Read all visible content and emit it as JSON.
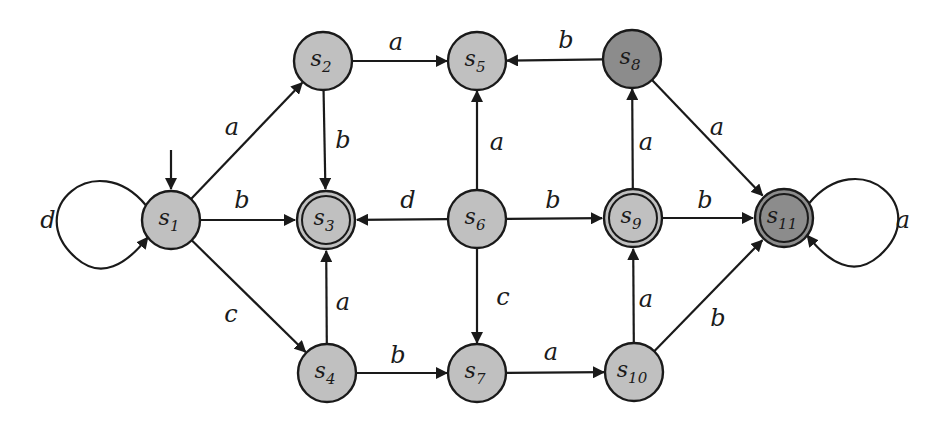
{
  "diagram": {
    "type": "finite-automaton",
    "colors": {
      "state_fill": "#c0c0c0",
      "state_fill_dark": "#8c8c8c",
      "stroke": "#1a1a1a",
      "background": "#ffffff"
    },
    "states": [
      {
        "id": "s1",
        "base": "s",
        "sub": "1",
        "x": 171,
        "y": 220,
        "accepting": false,
        "dark": false,
        "initial": true
      },
      {
        "id": "s2",
        "base": "s",
        "sub": "2",
        "x": 323,
        "y": 61,
        "accepting": false,
        "dark": false,
        "initial": false
      },
      {
        "id": "s3",
        "base": "s",
        "sub": "3",
        "x": 326,
        "y": 220,
        "accepting": true,
        "dark": false,
        "initial": false
      },
      {
        "id": "s4",
        "base": "s",
        "sub": "4",
        "x": 327,
        "y": 373,
        "accepting": false,
        "dark": false,
        "initial": false
      },
      {
        "id": "s5",
        "base": "s",
        "sub": "5",
        "x": 477,
        "y": 61,
        "accepting": false,
        "dark": false,
        "initial": false
      },
      {
        "id": "s6",
        "base": "s",
        "sub": "6",
        "x": 477,
        "y": 219,
        "accepting": false,
        "dark": false,
        "initial": false
      },
      {
        "id": "s7",
        "base": "s",
        "sub": "7",
        "x": 477,
        "y": 373,
        "accepting": false,
        "dark": false,
        "initial": false
      },
      {
        "id": "s8",
        "base": "s",
        "sub": "8",
        "x": 632,
        "y": 59,
        "accepting": false,
        "dark": true,
        "initial": false
      },
      {
        "id": "s9",
        "base": "s",
        "sub": "9",
        "x": 633,
        "y": 218,
        "accepting": true,
        "dark": false,
        "initial": false
      },
      {
        "id": "s10",
        "base": "s",
        "sub": "10",
        "x": 634,
        "y": 372,
        "accepting": false,
        "dark": false,
        "initial": false
      },
      {
        "id": "s11",
        "base": "s",
        "sub": "11",
        "x": 784,
        "y": 218,
        "accepting": true,
        "dark": true,
        "initial": false
      }
    ],
    "transitions": [
      {
        "from": "s1",
        "to": "s2",
        "label": "a",
        "lx": 232,
        "ly": 135
      },
      {
        "from": "s1",
        "to": "s3",
        "label": "b",
        "lx": 242,
        "ly": 208
      },
      {
        "from": "s1",
        "to": "s4",
        "label": "c",
        "lx": 231,
        "ly": 322
      },
      {
        "from": "s1",
        "to": "s1",
        "label": "d",
        "lx": 48,
        "ly": 228,
        "loop": "left"
      },
      {
        "from": "s2",
        "to": "s5",
        "label": "a",
        "lx": 396,
        "ly": 50
      },
      {
        "from": "s2",
        "to": "s3",
        "label": "b",
        "lx": 343,
        "ly": 148
      },
      {
        "from": "s4",
        "to": "s3",
        "label": "a",
        "lx": 343,
        "ly": 310
      },
      {
        "from": "s4",
        "to": "s7",
        "label": "b",
        "lx": 398,
        "ly": 363
      },
      {
        "from": "s6",
        "to": "s5",
        "label": "a",
        "lx": 497,
        "ly": 150
      },
      {
        "from": "s6",
        "to": "s3",
        "label": "d",
        "lx": 408,
        "ly": 208
      },
      {
        "from": "s6",
        "to": "s9",
        "label": "b",
        "lx": 553,
        "ly": 208
      },
      {
        "from": "s6",
        "to": "s7",
        "label": "c",
        "lx": 503,
        "ly": 305
      },
      {
        "from": "s7",
        "to": "s10",
        "label": "a",
        "lx": 551,
        "ly": 360
      },
      {
        "from": "s8",
        "to": "s5",
        "label": "b",
        "lx": 566,
        "ly": 48
      },
      {
        "from": "s8",
        "to": "s11",
        "label": "a",
        "lx": 717,
        "ly": 135
      },
      {
        "from": "s9",
        "to": "s8",
        "label": "a",
        "lx": 646,
        "ly": 150
      },
      {
        "from": "s9",
        "to": "s11",
        "label": "b",
        "lx": 705,
        "ly": 208
      },
      {
        "from": "s10",
        "to": "s9",
        "label": "a",
        "lx": 646,
        "ly": 307
      },
      {
        "from": "s10",
        "to": "s11",
        "label": "b",
        "lx": 718,
        "ly": 326
      },
      {
        "from": "s11",
        "to": "s11",
        "label": "a",
        "lx": 903,
        "ly": 228,
        "loop": "right"
      }
    ]
  }
}
